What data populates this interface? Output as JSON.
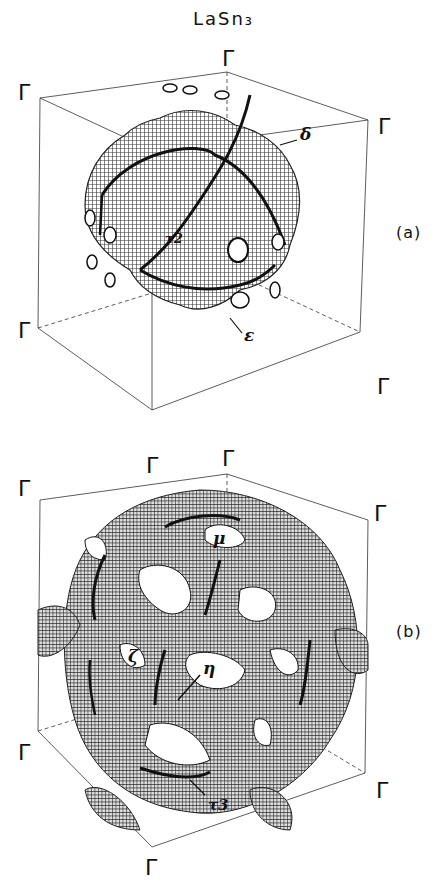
{
  "figure": {
    "title": "LaSn₃",
    "gamma_symbol": "Γ"
  },
  "panel_a": {
    "label": "(a)",
    "orbit_labels": {
      "tau2": "τ2",
      "delta": "δ",
      "epsilon": "ε"
    }
  },
  "panel_b": {
    "label": "(b)",
    "orbit_labels": {
      "mu": "μ",
      "zeta": "ζ",
      "eta": "η",
      "tau3": "τ3"
    }
  },
  "colors": {
    "line": "#222222",
    "mesh": "#333333",
    "background": "#ffffff"
  }
}
